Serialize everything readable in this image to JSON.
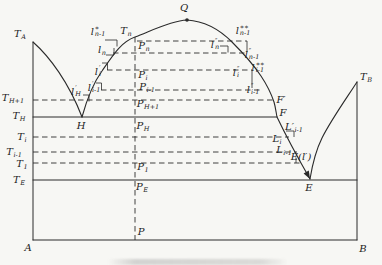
{
  "figure": {
    "type": "binary-phase-diagram-with-congruent-compound",
    "line_color": "#2a2a2a",
    "background_color": "#f7f7f4"
  },
  "labels": [
    {
      "id": "t-a",
      "x": 20,
      "y": 34,
      "base": "T",
      "sub": "A"
    },
    {
      "id": "t-h-plus-1",
      "x": 13,
      "y": 98,
      "base": "T",
      "sub": "H+1"
    },
    {
      "id": "t-h",
      "x": 19,
      "y": 116,
      "base": "T",
      "sub": "H"
    },
    {
      "id": "t-i",
      "x": 22,
      "y": 137,
      "base": "T",
      "sub": "i"
    },
    {
      "id": "t-i-minus-1",
      "x": 14,
      "y": 152,
      "base": "T",
      "sub": "i-1"
    },
    {
      "id": "t-1",
      "x": 22,
      "y": 164,
      "base": "T",
      "sub": "1"
    },
    {
      "id": "t-e",
      "x": 19,
      "y": 180,
      "base": "T",
      "sub": "E"
    },
    {
      "id": "corner-a",
      "x": 28,
      "y": 248,
      "base": "A"
    },
    {
      "id": "corner-b",
      "x": 363,
      "y": 249,
      "base": "B"
    },
    {
      "id": "p-bottom",
      "x": 141,
      "y": 232,
      "base": "P"
    },
    {
      "id": "q-max",
      "x": 184,
      "y": 8,
      "base": "Q"
    },
    {
      "id": "t-b",
      "x": 366,
      "y": 77,
      "base": "T",
      "sub": "B"
    },
    {
      "id": "t-n",
      "x": 126,
      "y": 31,
      "base": "T",
      "sub": "n"
    },
    {
      "id": "p-n",
      "x": 144,
      "y": 46,
      "base": "P",
      "sub": "n"
    },
    {
      "id": "p-i",
      "x": 143,
      "y": 75,
      "base": "P",
      "sub": "i"
    },
    {
      "id": "p-i-minus-1",
      "x": 147,
      "y": 87,
      "base": "P",
      "sub": "i-1"
    },
    {
      "id": "p-h-plus-1",
      "x": 148,
      "y": 104,
      "base": "P",
      "sub": "H+1"
    },
    {
      "id": "p-h",
      "x": 143,
      "y": 126,
      "base": "P",
      "sub": "H"
    },
    {
      "id": "p-1",
      "x": 143,
      "y": 167,
      "base": "P",
      "sub": "1"
    },
    {
      "id": "p-e",
      "x": 142,
      "y": 187,
      "base": "P",
      "sub": "E"
    },
    {
      "id": "l-star-n-1",
      "x": 98,
      "y": 31,
      "base": "l",
      "sup": "∗",
      "sub": "n-1"
    },
    {
      "id": "l-n",
      "x": 102,
      "y": 50,
      "base": "l",
      "sub": "n"
    },
    {
      "id": "l-prime-i",
      "x": 98,
      "y": 71,
      "base": "l",
      "sup": "′",
      "sub": "i"
    },
    {
      "id": "l-prime-i-1",
      "x": 94,
      "y": 87,
      "base": "l",
      "sup": "′",
      "sub": "i-1"
    },
    {
      "id": "l-prime-h",
      "x": 76,
      "y": 91,
      "base": "l",
      "sup": "′",
      "sub": "H"
    },
    {
      "id": "pt-h",
      "x": 81,
      "y": 126,
      "base": "H"
    },
    {
      "id": "l-dpr-n",
      "x": 215,
      "y": 44,
      "base": "l",
      "sup": "″",
      "sub": "n"
    },
    {
      "id": "l-dstar-n-1",
      "x": 243,
      "y": 30,
      "base": "l",
      "sup": "∗∗",
      "sub": "n-1"
    },
    {
      "id": "l-dpr-n-1",
      "x": 252,
      "y": 54,
      "base": "l",
      "sup": "″",
      "sub": "n-1"
    },
    {
      "id": "l-dpr-i",
      "x": 236,
      "y": 72,
      "base": "l",
      "sup": "″",
      "sub": "i"
    },
    {
      "id": "l-dstar-i-1",
      "x": 258,
      "y": 67,
      "base": "l",
      "sup": "∗∗",
      "sub": "i-1"
    },
    {
      "id": "l-dpr-i-1",
      "x": 253,
      "y": 89,
      "base": "l",
      "sup": "″",
      "sub": "i-1"
    },
    {
      "id": "f-prime",
      "x": 281,
      "y": 100,
      "base": "F′"
    },
    {
      "id": "pt-f",
      "x": 283,
      "y": 113,
      "base": "F"
    },
    {
      "id": "l-cap-pr-i-1",
      "x": 294,
      "y": 127,
      "base": "L′",
      "sub": "i-1"
    },
    {
      "id": "l-cap-i",
      "x": 277,
      "y": 139,
      "base": "L",
      "sub": "i"
    },
    {
      "id": "l-cap-i-1",
      "x": 284,
      "y": 150,
      "base": "L",
      "sub": "i-1"
    },
    {
      "id": "e-l-prime",
      "x": 301,
      "y": 157,
      "base": "E(l′)"
    },
    {
      "id": "pt-e",
      "x": 309,
      "y": 188,
      "base": "E"
    }
  ]
}
